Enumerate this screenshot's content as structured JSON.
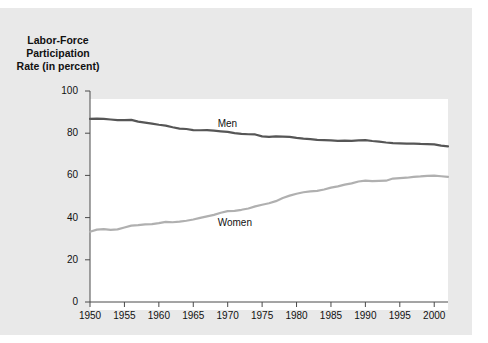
{
  "chart_data": {
    "type": "line",
    "title": "Labor-Force\nParticipation\nRate (in percent)",
    "xlabel": "",
    "ylabel": "",
    "ylim": [
      0,
      100
    ],
    "xlim": [
      1950,
      2002
    ],
    "yticks": [
      0,
      20,
      40,
      60,
      80,
      100
    ],
    "xticks": [
      1950,
      1955,
      1960,
      1965,
      1970,
      1975,
      1980,
      1985,
      1990,
      1995,
      2000
    ],
    "grid": false,
    "legend_position": "inline-annotation",
    "x": [
      1950,
      1951,
      1952,
      1953,
      1954,
      1955,
      1956,
      1957,
      1958,
      1959,
      1960,
      1961,
      1962,
      1963,
      1964,
      1965,
      1966,
      1967,
      1968,
      1969,
      1970,
      1971,
      1972,
      1973,
      1974,
      1975,
      1976,
      1977,
      1978,
      1979,
      1980,
      1981,
      1982,
      1983,
      1984,
      1985,
      1986,
      1987,
      1988,
      1989,
      1990,
      1991,
      1992,
      1993,
      1994,
      1995,
      1996,
      1997,
      1998,
      1999,
      2000,
      2001,
      2002
    ],
    "series": [
      {
        "name": "Men",
        "color": "#565656",
        "values": [
          86.8,
          86.9,
          86.8,
          86.5,
          86.2,
          86.2,
          86.3,
          85.5,
          85.0,
          84.5,
          84.0,
          83.6,
          82.8,
          82.2,
          82.0,
          81.5,
          81.4,
          81.5,
          81.2,
          80.9,
          80.6,
          80.0,
          79.7,
          79.5,
          79.4,
          78.5,
          78.3,
          78.5,
          78.4,
          78.3,
          77.8,
          77.4,
          77.2,
          76.8,
          76.7,
          76.6,
          76.4,
          76.5,
          76.4,
          76.6,
          76.7,
          76.3,
          76.0,
          75.6,
          75.3,
          75.2,
          75.1,
          75.1,
          74.9,
          74.8,
          74.7,
          74.1,
          73.8
        ]
      },
      {
        "name": "Women",
        "color": "#b0b0b0",
        "values": [
          33.3,
          34.3,
          34.5,
          34.2,
          34.4,
          35.3,
          36.2,
          36.4,
          36.8,
          36.9,
          37.4,
          38.0,
          37.8,
          38.1,
          38.5,
          39.1,
          39.9,
          40.6,
          41.3,
          42.3,
          43.1,
          43.2,
          43.7,
          44.3,
          45.3,
          46.1,
          46.8,
          47.8,
          49.3,
          50.4,
          51.3,
          52.0,
          52.4,
          52.7,
          53.3,
          54.2,
          54.8,
          55.6,
          56.2,
          57.1,
          57.5,
          57.3,
          57.4,
          57.5,
          58.5,
          58.7,
          58.9,
          59.3,
          59.5,
          59.8,
          59.9,
          59.6,
          59.3
        ]
      }
    ],
    "annotations": [
      {
        "text": "Men",
        "x": 1970,
        "y": 84
      },
      {
        "text": "Women",
        "x": 1970,
        "y": 37
      }
    ]
  }
}
